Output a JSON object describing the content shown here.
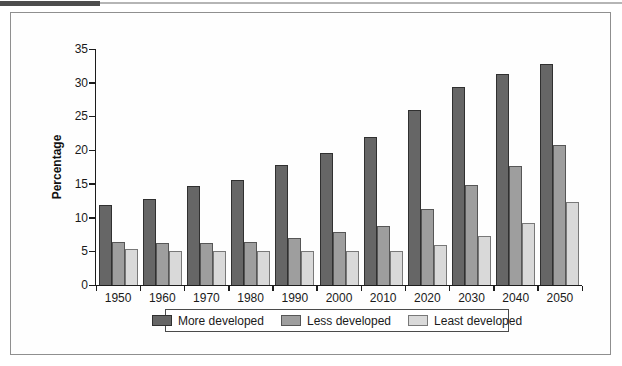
{
  "page": {
    "top_accent_color": "#4d4d4d",
    "top_rule_color": "#b5b5b5",
    "panel_border_color": "#8f8f8f"
  },
  "chart_data": {
    "type": "bar",
    "title": "",
    "xlabel": "",
    "ylabel": "Percentage",
    "ylim": [
      0,
      35
    ],
    "yticks": [
      0,
      5,
      10,
      15,
      20,
      25,
      30,
      35
    ],
    "grid": false,
    "legend_position": "bottom",
    "categories": [
      "1950",
      "1960",
      "1970",
      "1980",
      "1990",
      "2000",
      "2010",
      "2020",
      "2030",
      "2040",
      "2050"
    ],
    "series": [
      {
        "name": "More developed",
        "color": "#666666",
        "border_color": "#303030",
        "values": [
          11.8,
          12.8,
          14.7,
          15.6,
          17.8,
          19.6,
          21.9,
          26.0,
          29.4,
          31.3,
          32.8
        ]
      },
      {
        "name": "Less developed",
        "color": "#9e9e9e",
        "border_color": "#565656",
        "values": [
          6.4,
          6.2,
          6.2,
          6.4,
          6.9,
          7.8,
          8.7,
          11.3,
          14.8,
          17.6,
          20.7
        ]
      },
      {
        "name": "Least developed",
        "color": "#d9d9d9",
        "border_color": "#787878",
        "values": [
          5.4,
          5.0,
          5.0,
          5.0,
          5.0,
          5.1,
          5.1,
          6.0,
          7.2,
          9.2,
          12.3
        ]
      }
    ]
  }
}
